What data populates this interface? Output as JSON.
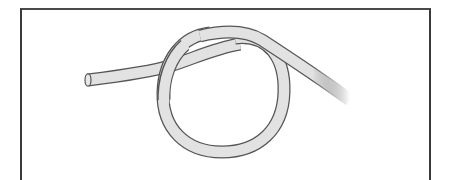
{
  "illustration": {
    "subject": "overhand knot",
    "description": "Line drawing of a single rope tied in a loose overhand knot inside a framed panel",
    "colors": {
      "rope_fill": "#e2e2e2",
      "rope_outline": "#555555",
      "frame": "#3a3a3a",
      "background": "#ffffff"
    }
  }
}
